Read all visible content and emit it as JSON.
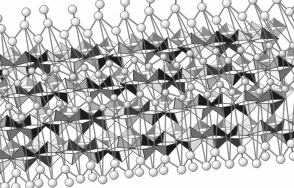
{
  "figure": {
    "description": "Grayscale crystallographic projection of a layered framework built from corner- and edge-sharing octahedra, overlaid with a ball-and-stick atomic network.",
    "render_style": "grayscale polyhedral + ball-and-stick",
    "background_color": "#fefefe",
    "width": 294,
    "height": 188
  },
  "view": {
    "slab_tilt_degrees": -6,
    "projection": "oblique",
    "slab_left_x": -18,
    "slab_right_x": 312,
    "slab_top_y": 28,
    "slab_bottom_y": 166,
    "layer_count": 4,
    "columns_per_layer": 13,
    "bleeds_off_left_edge": true,
    "bleeds_off_right_edge": true
  },
  "palette": {
    "background": "#fefefe",
    "polyhedron_dark": "#1b1b1b",
    "polyhedron_mid_dark": "#3a3a3a",
    "polyhedron_mid": "#6e6e6e",
    "polyhedron_light_gray": "#a8a8a8",
    "polyhedron_pale": "#d8d8d8",
    "polyhedron_white": "#f4f4f4",
    "edge_stroke": "#2a2a2a",
    "bond_stroke": "#707070",
    "bond_highlight": "#cfcfcf",
    "atom_fill": "#e9e9e9",
    "atom_highlight": "#fbfbfb",
    "atom_shadow": "#9a9a9a",
    "atom_outline": "#555555"
  },
  "geometry": {
    "octahedron_half_width": 15,
    "octahedron_half_height": 13,
    "layer_spacing_y": 35,
    "column_spacing_x": 24,
    "row_stagger_x": 12,
    "atom_radius_outer": 4.4,
    "atom_radius_inner": 1.6,
    "bond_width": 1.5,
    "edge_width": 0.6
  },
  "face_shade_cycle": [
    "polyhedron_dark",
    "polyhedron_white",
    "polyhedron_mid",
    "polyhedron_dark",
    "polyhedron_pale",
    "polyhedron_mid_dark",
    "polyhedron_white",
    "polyhedron_light_gray"
  ],
  "layers": [
    {
      "index": 0,
      "name": "top-surface-layer",
      "y_center": 52,
      "has_surface_atoms": true,
      "atom_row_y": 20,
      "atom_count": 27,
      "octahedra": 13
    },
    {
      "index": 1,
      "name": "upper-inner-layer",
      "y_center": 83,
      "has_surface_atoms": false,
      "atom_row_y": 64,
      "atom_count": 26,
      "octahedra": 13
    },
    {
      "index": 2,
      "name": "lower-inner-layer",
      "y_center": 114,
      "has_surface_atoms": false,
      "atom_row_y": 98,
      "atom_count": 26,
      "octahedra": 13
    },
    {
      "index": 3,
      "name": "bottom-surface-layer",
      "y_center": 145,
      "has_surface_atoms": true,
      "atom_row_y": 166,
      "atom_count": 27,
      "octahedra": 13
    }
  ],
  "legend": {
    "visible": false,
    "entries": []
  },
  "labels": {
    "visible": false,
    "axis_labels": [],
    "annotations": []
  },
  "scale_bar": {
    "visible": false
  }
}
